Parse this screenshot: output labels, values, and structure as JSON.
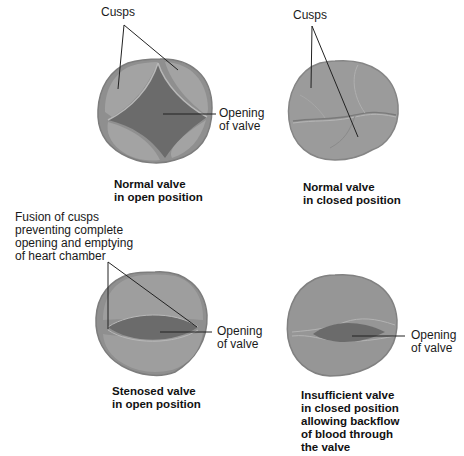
{
  "colors": {
    "valve_ring": "#8f8f8f",
    "valve_ring_edge": "#7d7d7d",
    "cusp": "#a3a3a3",
    "cusp_highlight": "#b8b8b8",
    "opening": "#6b6b6b",
    "leader_line": "#222222",
    "text": "#1a1a1a"
  },
  "panels": [
    {
      "id": "normal-open",
      "caption": [
        "Normal valve",
        "in open position"
      ],
      "labels": [
        {
          "key": "cusps",
          "text": [
            "Cusps"
          ]
        },
        {
          "key": "opening",
          "text": [
            "Opening",
            "of valve"
          ]
        }
      ]
    },
    {
      "id": "normal-closed",
      "caption": [
        "Normal valve",
        "in closed position"
      ],
      "labels": [
        {
          "key": "cusps",
          "text": [
            "Cusps"
          ]
        }
      ]
    },
    {
      "id": "stenosed-open",
      "caption": [
        "Stenosed valve",
        "in open position"
      ],
      "labels": [
        {
          "key": "fusion",
          "text": [
            "Fusion of cusps",
            "preventing complete",
            "opening and emptying",
            "of heart chamber"
          ]
        },
        {
          "key": "opening",
          "text": [
            "Opening",
            "of valve"
          ]
        }
      ]
    },
    {
      "id": "insufficient-closed",
      "caption": [
        "Insufficient valve",
        "in closed position",
        "allowing backflow",
        "of blood through",
        "the valve"
      ],
      "labels": [
        {
          "key": "opening",
          "text": [
            "Opening",
            "of valve"
          ]
        }
      ]
    }
  ]
}
